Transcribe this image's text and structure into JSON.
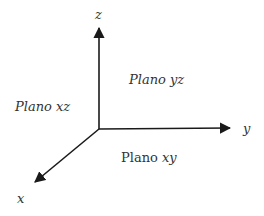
{
  "diagram": {
    "type": "3d-coordinate-axes",
    "origin": [
      99,
      129
    ],
    "line_color": "#1a1a1a",
    "axes": [
      {
        "name": "z",
        "label": "z",
        "tip": [
          99,
          27
        ],
        "direction": "up"
      },
      {
        "name": "y",
        "label": "y",
        "tip": [
          231,
          128
        ],
        "direction": "right"
      },
      {
        "name": "x",
        "label": "x",
        "tip": [
          34,
          183
        ],
        "direction": "down-left"
      }
    ],
    "planes": {
      "yz": {
        "word": "Plano",
        "vars": "yz",
        "word_italic": true
      },
      "xz": {
        "word": "Plano",
        "vars": "xz",
        "word_italic": true
      },
      "xy": {
        "word": "Plano",
        "vars": "xy",
        "word_italic": false
      }
    }
  }
}
